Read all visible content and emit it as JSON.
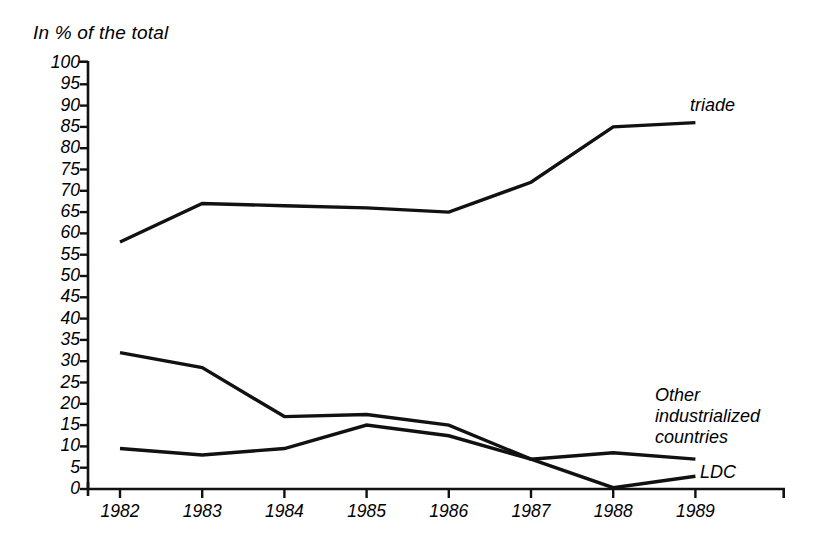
{
  "chart_data": {
    "type": "line",
    "title": "In % of the total",
    "xlabel": "",
    "ylabel": "In % of the total",
    "categories": [
      "1982",
      "1983",
      "1984",
      "1985",
      "1986",
      "1987",
      "1988",
      "1989"
    ],
    "x": [
      1982,
      1983,
      1984,
      1985,
      1986,
      1987,
      1988,
      1989
    ],
    "ylim": [
      0,
      100
    ],
    "xlim": [
      1982,
      1989
    ],
    "ytick_labels": [
      "100",
      "95",
      "90",
      "85",
      "80",
      "75",
      "70",
      "65",
      "60",
      "55",
      "50",
      "45",
      "40",
      "35",
      "30",
      "25",
      "20",
      "15",
      "10",
      "5",
      "0"
    ],
    "ytick_values": [
      100,
      95,
      90,
      85,
      80,
      75,
      70,
      65,
      60,
      55,
      50,
      45,
      40,
      35,
      30,
      25,
      20,
      15,
      10,
      5,
      0
    ],
    "grid": false,
    "legend_position": "inline-annotations",
    "line_color": "#111111",
    "background_color": "#ffffff",
    "series": [
      {
        "name": "triade",
        "label": "triade",
        "values": [
          58,
          67,
          66.5,
          66,
          65,
          72,
          85,
          86
        ]
      },
      {
        "name": "Other industrialized countries",
        "label": "Other\nindustrialized\ncountries",
        "values": [
          32,
          28.5,
          17,
          17.5,
          15,
          7,
          8.5,
          7
        ]
      },
      {
        "name": "LDC",
        "label": "LDC",
        "values": [
          9.5,
          8,
          9.5,
          15,
          12.5,
          7,
          0.3,
          3
        ]
      }
    ],
    "annotations": [
      {
        "text": "triade",
        "series": "triade",
        "x": 1988,
        "y": 92
      },
      {
        "text": "Other industrialized countries",
        "series": "Other industrialized countries",
        "x": 1988.2,
        "y": 22
      },
      {
        "text": "LDC",
        "series": "LDC",
        "x": 1989.05,
        "y": 4.5
      }
    ]
  }
}
